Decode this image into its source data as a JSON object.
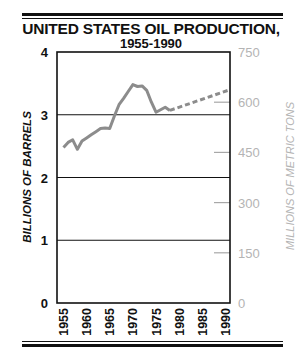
{
  "chart_data": {
    "type": "line",
    "title": "UNITED STATES OIL PRODUCTION,",
    "subtitle": "1955-1990",
    "xlabel": "",
    "ylabel": "BILLIONS OF BARRELS",
    "ylabel_right": "MILLIONS OF METRIC TONS",
    "ylim": [
      0,
      4
    ],
    "ylim_right": [
      0,
      750
    ],
    "xlim": [
      1953.6,
      1991
    ],
    "yticks": [
      0,
      1,
      2,
      3,
      4
    ],
    "yticks_right": [
      0,
      150,
      300,
      450,
      600,
      750
    ],
    "xticks": [
      1955,
      1960,
      1965,
      1970,
      1975,
      1980,
      1985,
      1990
    ],
    "grid": "horizontal lines at 1, 2, 3",
    "series": [
      {
        "name": "Actual production",
        "style": "solid",
        "color": "#8c8c8c",
        "x": [
          1955,
          1956,
          1957,
          1958,
          1959,
          1960,
          1961,
          1962,
          1963,
          1964,
          1965,
          1966,
          1967,
          1968,
          1969,
          1970,
          1971,
          1972,
          1973,
          1974,
          1975,
          1976,
          1977,
          1978
        ],
        "values": [
          2.48,
          2.56,
          2.6,
          2.45,
          2.58,
          2.63,
          2.68,
          2.73,
          2.78,
          2.79,
          2.78,
          2.98,
          3.16,
          3.26,
          3.37,
          3.48,
          3.45,
          3.46,
          3.39,
          3.2,
          3.04,
          3.08,
          3.12,
          3.07
        ]
      },
      {
        "name": "Projection",
        "style": "dashed",
        "color": "#8c8c8c",
        "x": [
          1978,
          1991
        ],
        "values": [
          3.07,
          3.4
        ]
      }
    ]
  },
  "labels": {
    "title_line1": "UNITED STATES OIL PRODUCTION,",
    "title_line2": "1955-1990",
    "ylabel_left": "BILLIONS OF BARRELS",
    "ylabel_right": "MILLIONS OF METRIC TONS",
    "yticks_left": [
      "0",
      "1",
      "2",
      "3",
      "4"
    ],
    "yticks_right": [
      "0",
      "150",
      "300",
      "450",
      "600",
      "750"
    ],
    "xticks": [
      "1955",
      "1960",
      "1965",
      "1970",
      "1975",
      "1980",
      "1985",
      "1990"
    ]
  },
  "colors": {
    "frame": "#111111",
    "line": "#8c8c8c",
    "right_axis_text": "#b4b4b4"
  }
}
